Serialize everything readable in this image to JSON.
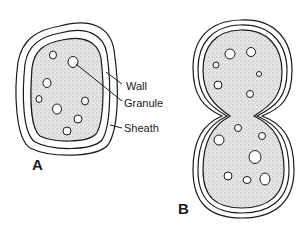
{
  "diagram": {
    "figures": [
      {
        "id": "A",
        "label": "A",
        "description": "single cell with wall, sheath and granules"
      },
      {
        "id": "B",
        "label": "B",
        "description": "dividing cell (constricted) with wall, sheath and granules"
      }
    ],
    "labels": {
      "wall": "Wall",
      "granule": "Granule",
      "sheath": "Sheath"
    },
    "colors": {
      "line": "#1a1a1a",
      "cytoplasm": "#d9d9d9",
      "background": "#ffffff"
    }
  }
}
